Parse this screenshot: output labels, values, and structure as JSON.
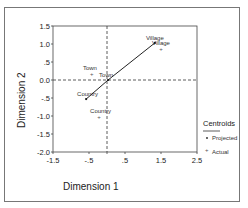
{
  "chart_data": {
    "type": "scatter",
    "title": "",
    "xlabel": "Dimension 1",
    "ylabel": "Dimension 2",
    "xlim": [
      -1.5,
      2.5
    ],
    "ylim": [
      -2.0,
      1.5
    ],
    "x_ticks": [
      "-1.5",
      "-.5",
      ".5",
      "1.5",
      "2.5"
    ],
    "y_ticks": [
      "1.5",
      "1.0",
      ".5",
      "0.0",
      "-.5",
      "-1.0",
      "-1.5",
      "-2.0"
    ],
    "reference_lines": {
      "x": 0.0,
      "y": 0.0,
      "style": "dashed"
    },
    "grid": false,
    "legend": {
      "title": "Centroids",
      "position": "right",
      "entries": [
        "Projected",
        "Actual"
      ]
    },
    "series": [
      {
        "name": "Projected",
        "points": [
          {
            "label": "Village",
            "x": 1.33,
            "y": 1.03
          },
          {
            "label": "Town",
            "x": 0.03,
            "y": 0.0
          },
          {
            "label": "Country",
            "x": -0.58,
            "y": -0.53
          }
        ],
        "connected_line": true
      },
      {
        "name": "Actual",
        "points": [
          {
            "label": "Village",
            "x": 1.5,
            "y": 0.86
          },
          {
            "label": "Town",
            "x": -0.42,
            "y": 0.17
          },
          {
            "label": "Country",
            "x": -0.22,
            "y": -1.03
          }
        ]
      }
    ]
  }
}
